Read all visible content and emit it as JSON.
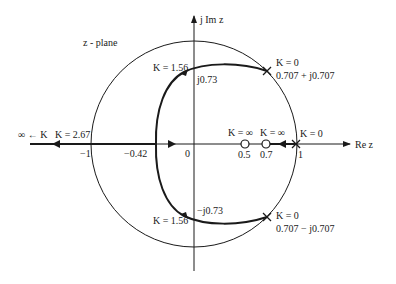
{
  "diagram": {
    "type": "root-locus",
    "plane_label": "z - plane",
    "axes": {
      "imag_label": "j Im z",
      "real_label": "Re z"
    },
    "tick_labels": {
      "minus_one": "−1",
      "minus_042": "−0.42",
      "zero": "0",
      "half": "0.5",
      "point7": "0.7",
      "one": "1"
    },
    "annotations": {
      "k_inf_left": "∞ ← K",
      "k_267": "K = 2.67",
      "k_156_top": "K = 1.56",
      "j073": "j0.73",
      "k0_top": "K = 0",
      "pole_top": "0.707 + j0.707",
      "k_inf_zero1": "K = ∞",
      "k_inf_zero2": "K = ∞",
      "k0_right": "K = 0",
      "k_156_bottom": "K = 1.56",
      "mj073": "−j0.73",
      "k0_bottom": "K = 0",
      "pole_bottom": "0.707 − j0.707"
    },
    "colors": {
      "stroke": "#1a1a1a",
      "background": "#ffffff"
    }
  }
}
